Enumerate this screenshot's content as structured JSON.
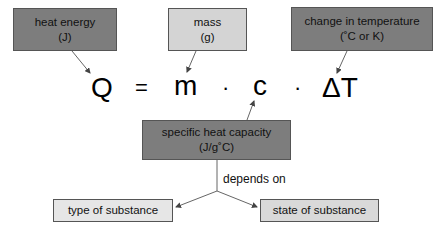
{
  "top_boxes": {
    "heat_energy": {
      "title": "heat energy",
      "unit": "(J)"
    },
    "mass": {
      "title": "mass",
      "unit": "(g)"
    },
    "delta_temp": {
      "title": "change in temperature",
      "unit": "(˚C or K)"
    }
  },
  "equation": {
    "Q": "Q",
    "equals": "=",
    "m": "m",
    "dot1": "·",
    "c": "c",
    "dot2": "·",
    "deltaT": "ΔT"
  },
  "center_box": {
    "title": "specific heat capacity",
    "unit": "(J/g˚C)"
  },
  "relation_label": "depends on",
  "bottom_boxes": {
    "type": "type of substance",
    "state": "state of substance"
  },
  "colors": {
    "dark_box": "#7d7d7d",
    "light_box": "#d4d4d4",
    "pale_box": "#e6e6e6",
    "line": "#555555"
  }
}
